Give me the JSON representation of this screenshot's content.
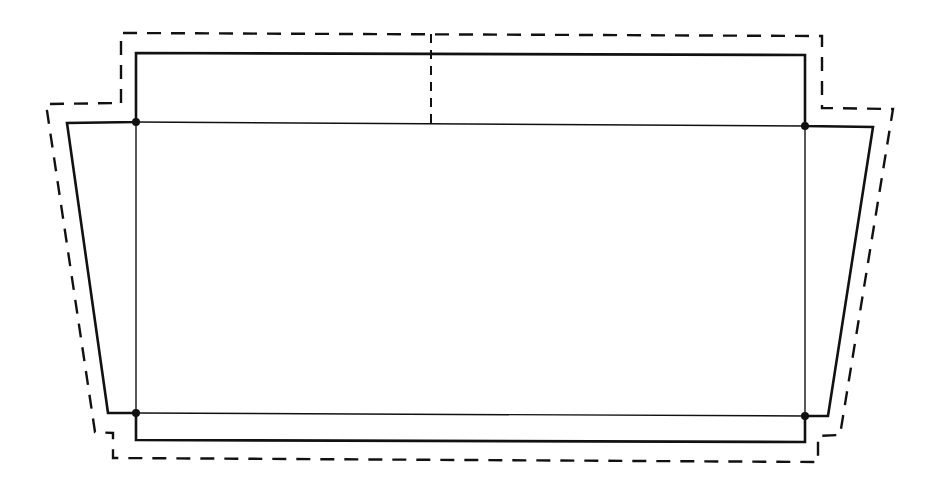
{
  "diagram": {
    "type": "outline-plan",
    "colors": {
      "line": "#111111",
      "background": "#ffffff"
    },
    "solid_outline": {
      "upper_box": [
        [
          136,
          123
        ],
        [
          136,
          53
        ],
        [
          805,
          55
        ],
        [
          805,
          126
        ]
      ],
      "wide_trapezoid": [
        [
          136,
          122
        ],
        [
          67,
          123
        ],
        [
          108,
          413
        ],
        [
          136,
          413
        ]
      ],
      "wide_trapezoid_right": [
        [
          805,
          126
        ],
        [
          873,
          127
        ],
        [
          828,
          416
        ],
        [
          805,
          416
        ]
      ],
      "bottom_box": [
        [
          136,
          413
        ],
        [
          136,
          440
        ],
        [
          805,
          442
        ],
        [
          805,
          416
        ]
      ]
    },
    "inner_lines": {
      "top_horizontal": [
        [
          136,
          122
        ],
        [
          805,
          126
        ]
      ],
      "bottom_horizontal": [
        [
          136,
          413
        ],
        [
          805,
          416
        ]
      ],
      "left_vertical": [
        [
          136,
          122
        ],
        [
          136,
          413
        ]
      ],
      "right_vertical": [
        [
          805,
          126
        ],
        [
          805,
          416
        ]
      ]
    },
    "dashed_outline": [
      [
        121,
        103
      ],
      [
        121,
        33
      ],
      [
        822,
        36
      ],
      [
        822,
        108
      ],
      [
        893,
        109
      ],
      [
        840,
        435
      ],
      [
        818,
        436
      ],
      [
        818,
        462
      ],
      [
        113,
        458
      ],
      [
        113,
        433
      ],
      [
        95,
        432
      ],
      [
        46,
        104
      ],
      [
        121,
        103
      ]
    ],
    "dashed_center_line": [
      [
        431,
        34
      ],
      [
        431,
        124
      ]
    ],
    "nodes": [
      [
        136,
        122
      ],
      [
        805,
        126
      ],
      [
        136,
        413
      ],
      [
        805,
        416
      ]
    ]
  }
}
